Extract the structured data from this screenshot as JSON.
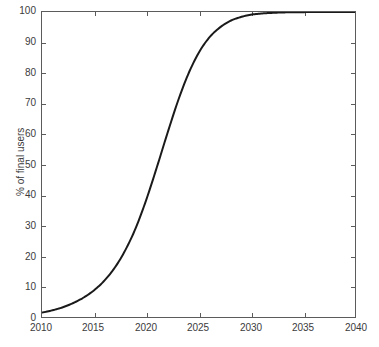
{
  "chart_data": {
    "type": "line",
    "title": "",
    "subtitle": "",
    "xlabel": "",
    "ylabel": "% of final users",
    "xlim": [
      2010,
      2040
    ],
    "ylim": [
      0,
      100
    ],
    "xticks": [
      2010,
      2015,
      2020,
      2025,
      2030,
      2035,
      2040
    ],
    "xtick_labels": [
      "2010",
      "2015",
      "2020",
      "2025",
      "2030",
      "2035",
      "2040"
    ],
    "yticks": [
      0,
      10,
      20,
      30,
      40,
      50,
      60,
      70,
      80,
      90,
      100
    ],
    "ytick_labels": [
      "0",
      "10",
      "20",
      "30",
      "40",
      "50",
      "60",
      "70",
      "80",
      "90",
      "100"
    ],
    "grid": false,
    "legend": null,
    "legend_position": "none",
    "line_color": "#1a1a1a",
    "line_width": 2,
    "axis_color": "#5b5b5b",
    "background_color": "#ffffff",
    "annotations": [],
    "series": [
      {
        "name": "adoption",
        "x": [
          2010,
          2011,
          2012,
          2013,
          2014,
          2015,
          2016,
          2017,
          2018,
          2019,
          2020,
          2021,
          2022,
          2023,
          2024,
          2025,
          2026,
          2027,
          2028,
          2029,
          2030,
          2031,
          2032,
          2033,
          2034,
          2035,
          2036,
          2037,
          2038,
          2039,
          2040
        ],
        "values": [
          1.5,
          2.2,
          3.2,
          4.6,
          6.4,
          8.8,
          12.0,
          16.3,
          22.0,
          29.3,
          38.5,
          49.0,
          60.0,
          70.5,
          79.5,
          86.5,
          91.5,
          94.8,
          97.0,
          98.3,
          99.1,
          99.5,
          99.7,
          99.85,
          99.9,
          99.95,
          99.97,
          99.98,
          99.99,
          100.0,
          100.0
        ]
      }
    ]
  },
  "axes": {
    "ylabel_text": "% of final users"
  }
}
